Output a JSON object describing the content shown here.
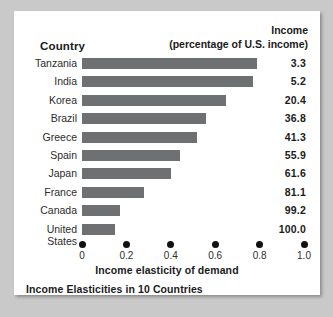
{
  "header": {
    "country_label": "Country",
    "income_line1": "Income",
    "income_line2": "(percentage of U.S. income)"
  },
  "axis": {
    "title": "Income elasticity of demand",
    "ticks": [
      "0",
      "0.2",
      "0.4",
      "0.6",
      "0.8",
      "1.0"
    ]
  },
  "caption": "Income Elasticities in 10 Countries",
  "colors": {
    "bar": "#6e7072",
    "card": "#ffffff",
    "page": "#c9c9c9",
    "text": "#1b1b1b"
  },
  "chart_data": {
    "type": "bar",
    "orientation": "horizontal",
    "title": "Income Elasticities in 10 Countries",
    "xlabel": "Income elasticity of demand",
    "ylabel": "Country",
    "xlim": [
      0,
      1.0
    ],
    "xticks": [
      0,
      0.2,
      0.4,
      0.6,
      0.8,
      1.0
    ],
    "grid": false,
    "legend": false,
    "categories": [
      "Tanzania",
      "India",
      "Korea",
      "Brazil",
      "Greece",
      "Spain",
      "Japan",
      "France",
      "Canada",
      "United States"
    ],
    "values": [
      0.79,
      0.77,
      0.65,
      0.56,
      0.52,
      0.44,
      0.4,
      0.28,
      0.17,
      0.15
    ],
    "series": [
      {
        "name": "Income elasticity of demand",
        "values": [
          0.79,
          0.77,
          0.65,
          0.56,
          0.52,
          0.44,
          0.4,
          0.28,
          0.17,
          0.15
        ]
      },
      {
        "name": "Income (percentage of U.S. income)",
        "values": [
          3.3,
          5.2,
          20.4,
          36.8,
          41.3,
          55.9,
          61.6,
          81.1,
          99.2,
          100.0
        ]
      }
    ],
    "rows": [
      {
        "country": "Tanzania",
        "elasticity": 0.79,
        "income": "3.3"
      },
      {
        "country": "India",
        "elasticity": 0.77,
        "income": "5.2"
      },
      {
        "country": "Korea",
        "elasticity": 0.65,
        "income": "20.4"
      },
      {
        "country": "Brazil",
        "elasticity": 0.56,
        "income": "36.8"
      },
      {
        "country": "Greece",
        "elasticity": 0.52,
        "income": "41.3"
      },
      {
        "country": "Spain",
        "elasticity": 0.44,
        "income": "55.9"
      },
      {
        "country": "Japan",
        "elasticity": 0.4,
        "income": "61.6"
      },
      {
        "country": "France",
        "elasticity": 0.28,
        "income": "81.1"
      },
      {
        "country": "Canada",
        "elasticity": 0.17,
        "income": "99.2"
      },
      {
        "country": "United States",
        "elasticity": 0.15,
        "income": "100.0"
      }
    ]
  }
}
